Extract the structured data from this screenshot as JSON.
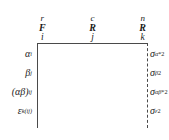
{
  "figure": {
    "type": "ems-table-skeleton"
  },
  "columns": [
    {
      "level": "r",
      "model": "F",
      "index": "i",
      "name": "factor-a-column"
    },
    {
      "level": "c",
      "model": "R",
      "index": "j",
      "name": "factor-b-column"
    },
    {
      "level": "n",
      "model": "R",
      "index": "k",
      "name": "error-column"
    }
  ],
  "rows": [
    {
      "effect_symbol": "α",
      "effect_sub": "i",
      "effect_paren": false,
      "variance_symbol": "σ",
      "variance_sub": "α",
      "variance_sup": "*2",
      "name": "alpha"
    },
    {
      "effect_symbol": "β",
      "effect_sub": "j",
      "effect_paren": false,
      "variance_symbol": "σ",
      "variance_sub": "β",
      "variance_sup": "2",
      "name": "beta"
    },
    {
      "effect_symbol": "αβ",
      "effect_sub": "ij",
      "effect_paren": true,
      "variance_symbol": "σ",
      "variance_sub": "αβ",
      "variance_sup": "*2",
      "name": "alpha-beta"
    },
    {
      "effect_symbol": "ε",
      "effect_sub": "k(ij)",
      "effect_paren": false,
      "variance_symbol": "σ",
      "variance_sub": "ε",
      "variance_sup": "2",
      "name": "epsilon"
    }
  ],
  "colors": {
    "rule": "#4a4a4a",
    "text": "#1a1a1a",
    "background": "#ffffff"
  }
}
